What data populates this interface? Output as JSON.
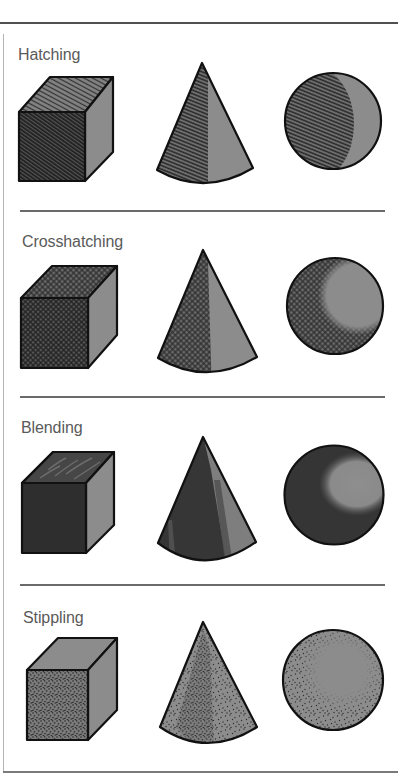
{
  "sections": [
    {
      "label": "Hatching",
      "technique": "hatching",
      "shapes": [
        "cube",
        "cone",
        "sphere"
      ]
    },
    {
      "label": "Crosshatching",
      "technique": "crosshatching",
      "shapes": [
        "cube",
        "cone",
        "sphere"
      ]
    },
    {
      "label": "Blending",
      "technique": "blending",
      "shapes": [
        "cube",
        "cone",
        "sphere"
      ]
    },
    {
      "label": "Stippling",
      "technique": "stippling",
      "shapes": [
        "cube",
        "cone",
        "sphere"
      ]
    }
  ],
  "colors": {
    "outline": "#111111",
    "base_fill": "#8c8c8c",
    "shade": "#333333",
    "label_text": "#5a5a5a",
    "rules": "#505050"
  }
}
